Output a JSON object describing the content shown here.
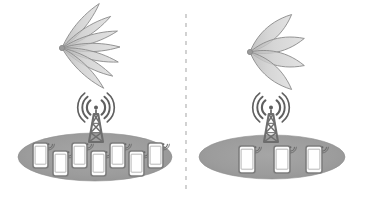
{
  "figure": {
    "title": "",
    "width": 366,
    "height": 200,
    "background": "#ffffff",
    "style": "grayscale line diagram"
  },
  "colors": {
    "background": "#ffffff",
    "coverage_ellipse_fill": "#9d9d9d",
    "coverage_ellipse_edge": "#8e8e8e",
    "lobe_fill": "#c9c9c9",
    "lobe_edge": "#8a8a8a",
    "tower_stroke": "#6e6e6e",
    "signal_arc": "#5f5f5f",
    "phone_body": "#fdfdfd",
    "phone_edge": "#7d7d7d",
    "phone_signal": "#6a6a6a",
    "divider": "#b4b4b4"
  },
  "divider": {
    "name": "panel-divider",
    "orientation": "vertical",
    "x": 186,
    "y_start": 14,
    "y_end": 189,
    "dash": "4 5",
    "width": 1.2,
    "color": "#b4b4b4"
  },
  "panels": [
    {
      "id": "left",
      "label": "",
      "beam_pattern": {
        "name": "narrow-multi-lobe-beam",
        "apex_x": 62,
        "apex_y": 48,
        "lobe_count": 7,
        "lobe_length": 58,
        "lobe_half_width": 7.5,
        "angles_deg": [
          -50,
          -33,
          -17,
          -1,
          14,
          29,
          44
        ],
        "description": "seven narrow directional beams fanning to the right"
      },
      "tower": {
        "name": "cell-tower",
        "x": 96,
        "base_y": 142,
        "height": 28,
        "arc_count": 3,
        "has_signal_arcs": true
      },
      "coverage": {
        "name": "coverage-ellipse",
        "cx": 95,
        "cy": 157,
        "rx": 77,
        "ry": 24
      },
      "devices": {
        "count": 7,
        "items": [
          {
            "id": "phone-1",
            "x": 33,
            "y": 143,
            "w": 15,
            "h": 25
          },
          {
            "id": "phone-2",
            "x": 53,
            "y": 151,
            "w": 15,
            "h": 25
          },
          {
            "id": "phone-3",
            "x": 72,
            "y": 143,
            "w": 15,
            "h": 25
          },
          {
            "id": "phone-4",
            "x": 91,
            "y": 151,
            "w": 15,
            "h": 25
          },
          {
            "id": "phone-5",
            "x": 110,
            "y": 143,
            "w": 15,
            "h": 25
          },
          {
            "id": "phone-6",
            "x": 129,
            "y": 151,
            "w": 15,
            "h": 25
          },
          {
            "id": "phone-7",
            "x": 148,
            "y": 143,
            "w": 15,
            "h": 25
          }
        ]
      }
    },
    {
      "id": "right",
      "label": "",
      "beam_pattern": {
        "name": "wide-multi-lobe-beam",
        "apex_x": 250,
        "apex_y": 52,
        "lobe_count": 4,
        "lobe_length": 56,
        "lobe_half_width": 12,
        "angles_deg": [
          -42,
          -14,
          14,
          42
        ],
        "description": "four wide directional beams fanning to the right"
      },
      "tower": {
        "name": "cell-tower",
        "x": 271,
        "base_y": 142,
        "height": 28,
        "arc_count": 3,
        "has_signal_arcs": true
      },
      "coverage": {
        "name": "coverage-ellipse",
        "cx": 272,
        "cy": 157,
        "rx": 73,
        "ry": 22
      },
      "devices": {
        "count": 3,
        "items": [
          {
            "id": "phone-1",
            "x": 239,
            "y": 146,
            "w": 16,
            "h": 27
          },
          {
            "id": "phone-2",
            "x": 274,
            "y": 146,
            "w": 16,
            "h": 27
          },
          {
            "id": "phone-3",
            "x": 306,
            "y": 146,
            "w": 16,
            "h": 27
          }
        ]
      }
    }
  ]
}
